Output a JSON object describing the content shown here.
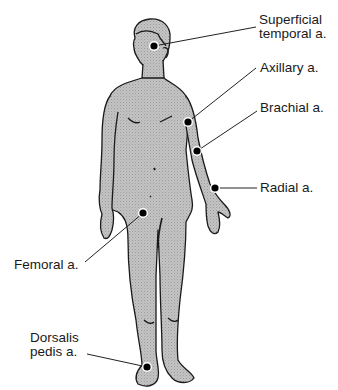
{
  "diagram": {
    "colors": {
      "skin_fill": "#bdbdbd",
      "outline": "#1a1a1a",
      "dot": "#000000",
      "leader_line": "#222222",
      "text": "#1a1a1a",
      "background": "#ffffff"
    },
    "pulse_points": [
      {
        "id": "superficial-temporal",
        "line1": "Superficial",
        "line2": "temporal a.",
        "dot": [
          154,
          46
        ]
      },
      {
        "id": "axillary",
        "line1": "Axillary a.",
        "line2": "",
        "dot": [
          188,
          122
        ]
      },
      {
        "id": "brachial",
        "line1": "Brachial a.",
        "line2": "",
        "dot": [
          197,
          151
        ]
      },
      {
        "id": "radial",
        "line1": "Radial a.",
        "line2": "",
        "dot": [
          215,
          188
        ]
      },
      {
        "id": "femoral",
        "line1": "Femoral a.",
        "line2": "",
        "dot": [
          143,
          213
        ]
      },
      {
        "id": "dorsalis-pedis",
        "line1": "Dorsalis",
        "line2": "pedis a.",
        "dot": [
          147,
          367
        ]
      }
    ]
  }
}
